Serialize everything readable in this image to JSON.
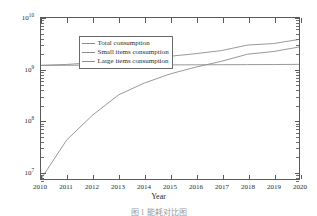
{
  "chart_data": {
    "type": "line",
    "title": "",
    "xlabel": "Year",
    "ylabel": "Energy consumption(kwh)",
    "yscale": "log",
    "xscale": "linear",
    "xlim": [
      2010,
      2020
    ],
    "ylim": [
      7000000,
      10000000000
    ],
    "grid": false,
    "legend_position": "upper-left",
    "x": [
      2010,
      2011,
      2012,
      2013,
      2014,
      2015,
      2016,
      2017,
      2018,
      2019,
      2020
    ],
    "xtick_labels": [
      "2010",
      "2011",
      "2012",
      "2013",
      "2014",
      "2015",
      "2016",
      "2017",
      "2018",
      "2019",
      "2020"
    ],
    "ytick_labels": [
      "10⁷",
      "10⁸",
      "10⁹",
      "10¹⁰"
    ],
    "ytick_values": [
      10000000,
      100000000,
      1000000000,
      10000000000
    ],
    "ytick_mantissas": [
      "10",
      "10",
      "10",
      "10"
    ],
    "ytick_exponents": [
      "7",
      "8",
      "9",
      "10"
    ],
    "series": [
      {
        "name": "Total consumption",
        "color": "#8d8d8d",
        "values": [
          1180000000,
          1230000000,
          1330000000,
          1450000000,
          1600000000,
          1780000000,
          2000000000,
          2300000000,
          2950000000,
          3150000000,
          3800000000
        ]
      },
      {
        "name": "Small items consumption",
        "color": "#8d8d8d",
        "values": [
          1180000000,
          1185000000,
          1190000000,
          1195000000,
          1200000000,
          1205000000,
          1210000000,
          1215000000,
          1220000000,
          1225000000,
          1235000000
        ]
      },
      {
        "name": "Large items consumption",
        "color": "#8d8d8d",
        "values": [
          7000000,
          41000000,
          125000000,
          310000000,
          530000000,
          800000000,
          1090000000,
          1420000000,
          1950000000,
          2200000000,
          2700000000
        ]
      }
    ]
  },
  "legend": {
    "items": [
      {
        "label": "Total consumption"
      },
      {
        "label": "Small items consumption"
      },
      {
        "label": "Large items consumption"
      }
    ]
  },
  "axes": {
    "x_title": "Year",
    "y_title": "Energy consumption(kwh)"
  },
  "caption": {
    "text": "图 1 能耗对比图"
  }
}
